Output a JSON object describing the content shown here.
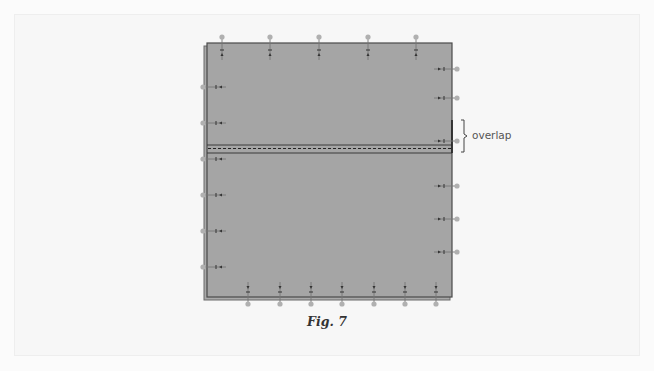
{
  "figure": {
    "caption": "Fig. 7",
    "callout_label": "overlap",
    "colors": {
      "background": "#fbfbfb",
      "fabric": "#a5a5a5",
      "fabric_edge": "#4a4a4a",
      "pin_head": "#b0b0b0",
      "pin_line": "#777777",
      "stitch_line": "#2a2a2a"
    },
    "panel": {
      "x": 207,
      "y": 43,
      "width": 245,
      "height": 254
    },
    "overlap_band": {
      "y_top": 145,
      "y_bottom": 153,
      "stitch_y": 148.5
    },
    "pins": {
      "top": [
        222,
        270,
        319,
        368,
        416
      ],
      "bottom": [
        248,
        280,
        311,
        342,
        374,
        405,
        436
      ],
      "left": [
        87,
        123,
        159,
        195,
        231,
        267
      ],
      "right": [
        69,
        98,
        141,
        186,
        219,
        252
      ]
    }
  }
}
